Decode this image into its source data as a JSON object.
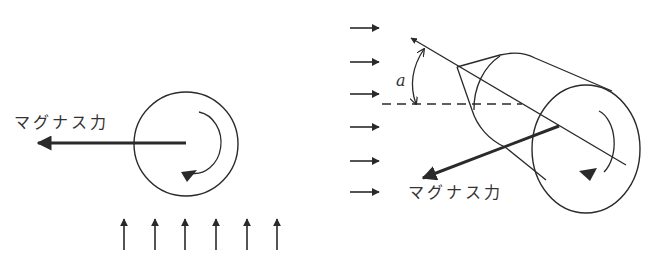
{
  "figure": {
    "type": "magnus-force-diagram",
    "colors": {
      "ink": "#2a2a2a",
      "background": "#ffffff"
    },
    "left_panel": {
      "force_label": "マグナス力",
      "flow_direction": "up",
      "flow_arrow_count": 6,
      "rotation": "clockwise"
    },
    "right_panel": {
      "force_label": "マグナス力",
      "angle_label": "a",
      "flow_direction": "right",
      "flow_arrow_count": 6,
      "rotation": "clockwise"
    }
  }
}
